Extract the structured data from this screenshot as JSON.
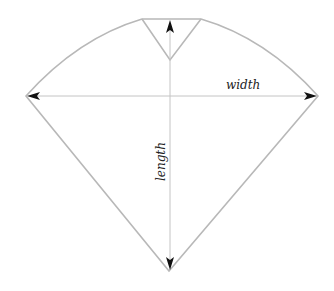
{
  "diagram": {
    "title": "",
    "labels": {
      "width": "width",
      "length": "length"
    },
    "colors": {
      "outline": "#b8b8b8",
      "arrow_line": "#c4c4c4",
      "arrowhead": "#111111",
      "background": "#ffffff"
    },
    "shape": "cone/pattern piece with top notch"
  }
}
